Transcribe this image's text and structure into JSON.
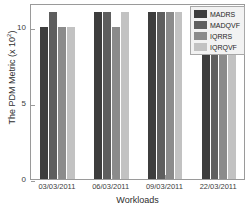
{
  "chart_data": {
    "type": "bar",
    "title": "",
    "xlabel": "Workloads",
    "ylabel": "The PDM Metric (x 10",
    "ylabel_exponent": "2",
    "ylabel_suffix": ")",
    "categories": [
      "03/03/2011",
      "06/03/2011",
      "09/03/2011",
      "22/03/2011"
    ],
    "series": [
      {
        "name": "MADRS",
        "color": "#3d3d3d",
        "values": [
          10,
          11,
          11,
          11
        ]
      },
      {
        "name": "MADQVF",
        "color": "#5e5e5e",
        "values": [
          11,
          11,
          11,
          11
        ]
      },
      {
        "name": "IQRRS",
        "color": "#8b8b8b",
        "values": [
          10,
          10,
          11,
          11
        ]
      },
      {
        "name": "IQRQVF",
        "color": "#c2c2c2",
        "values": [
          10,
          11,
          11,
          11
        ]
      }
    ],
    "ylim": [
      0,
      11.6
    ],
    "yticks": [
      0,
      5,
      10
    ],
    "ytick_labels": [
      "0",
      "5",
      "10"
    ],
    "grid": false,
    "legend_position": "top-right",
    "legend_entries": [
      "MADRS",
      "MADQVF",
      "IQRRS",
      "IQRQVF"
    ],
    "axis_color": "#9a9a9a",
    "background_color": "#ffffff"
  }
}
